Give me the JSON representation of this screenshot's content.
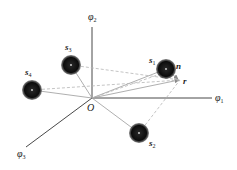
{
  "diagram": {
    "type": "vector-space-diagram",
    "origin": {
      "label": "O",
      "x": 92,
      "y": 98
    },
    "axes": [
      {
        "id": "phi1",
        "symbol": "φ",
        "subscript": "1",
        "end": {
          "x": 212,
          "y": 98
        },
        "label_pos": {
          "x": 216,
          "y": 101
        }
      },
      {
        "id": "phi2",
        "symbol": "φ",
        "subscript": "2",
        "end": {
          "x": 92,
          "y": 27
        },
        "label_pos": {
          "x": 88,
          "y": 20
        }
      },
      {
        "id": "phi3",
        "symbol": "φ",
        "subscript": "3",
        "end": {
          "x": 26,
          "y": 147
        },
        "label_pos": {
          "x": 16,
          "y": 158
        }
      }
    ],
    "spheres": [
      {
        "id": "s1",
        "symbol": "s",
        "subscript": "1",
        "center": {
          "x": 166,
          "y": 69
        },
        "radius": 10,
        "label_pos": {
          "x": 148,
          "y": 62
        }
      },
      {
        "id": "s2",
        "symbol": "s",
        "subscript": "2",
        "center": {
          "x": 139,
          "y": 133
        },
        "radius": 10,
        "label_pos": {
          "x": 148,
          "y": 146
        }
      },
      {
        "id": "s3",
        "symbol": "s",
        "subscript": "3",
        "center": {
          "x": 71,
          "y": 65
        },
        "radius": 10,
        "label_pos": {
          "x": 65,
          "y": 50
        }
      },
      {
        "id": "s4",
        "symbol": "s",
        "subscript": "4",
        "center": {
          "x": 32,
          "y": 90
        },
        "radius": 10,
        "label_pos": {
          "x": 25,
          "y": 75
        }
      }
    ],
    "vectors": [
      {
        "id": "n",
        "label": "n",
        "label_pos": {
          "x": 176,
          "y": 68
        }
      },
      {
        "id": "r",
        "label": "r",
        "label_pos": {
          "x": 183,
          "y": 84
        },
        "tip": {
          "x": 180,
          "y": 80
        }
      }
    ],
    "colors": {
      "axis": "#333333",
      "solid_line": "#9a9a9a",
      "dashed_line": "#b5b5b5",
      "sphere": "#111111",
      "text": "#1a1a1a"
    }
  }
}
